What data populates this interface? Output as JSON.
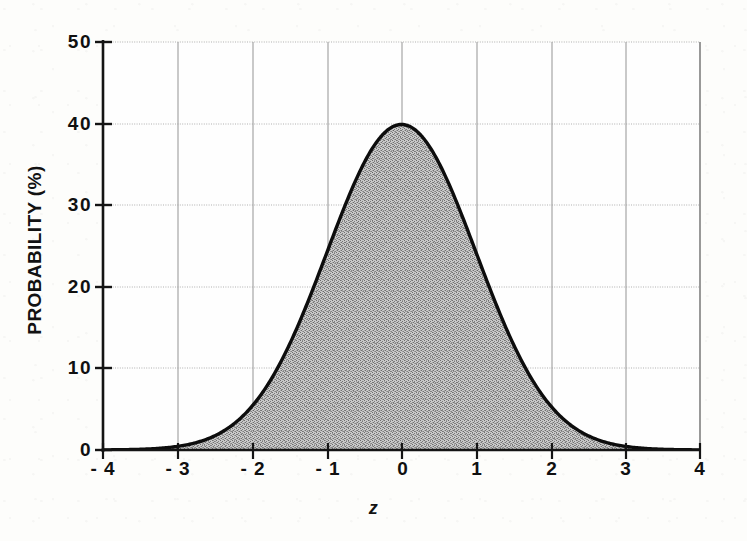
{
  "chart_data": {
    "type": "area",
    "title": "",
    "subtitle": "",
    "xlabel": "z",
    "ylabel": "PROBABILITY (%)",
    "xlim": [
      -4,
      4
    ],
    "ylim": [
      0,
      50
    ],
    "grid": true,
    "legend_position": "none",
    "curve_name": "standard normal probability density (percent)",
    "fill": "gray-dither-hatch",
    "x_tick_labels": [
      "- 4",
      "- 3",
      "- 2",
      "- 1",
      "0",
      "1",
      "2",
      "3",
      "4"
    ],
    "x_tick_values": [
      -4,
      -3,
      -2,
      -1,
      0,
      1,
      2,
      3,
      4
    ],
    "y_tick_labels": [
      "0",
      "10",
      "20",
      "30",
      "40",
      "50"
    ],
    "y_tick_values": [
      0,
      10,
      20,
      30,
      40,
      50
    ],
    "x": [
      -4,
      -3.75,
      -3.5,
      -3.25,
      -3,
      -2.75,
      -2.5,
      -2.25,
      -2,
      -1.75,
      -1.5,
      -1.25,
      -1,
      -0.75,
      -0.5,
      -0.25,
      0,
      0.25,
      0.5,
      0.75,
      1,
      1.25,
      1.5,
      1.75,
      2,
      2.25,
      2.5,
      2.75,
      3,
      3.25,
      3.5,
      3.75,
      4
    ],
    "values": [
      0.01,
      0.03,
      0.09,
      0.2,
      0.44,
      0.91,
      1.75,
      3.17,
      5.4,
      8.63,
      12.95,
      18.26,
      24.2,
      30.11,
      35.21,
      38.67,
      39.89,
      38.67,
      35.21,
      30.11,
      24.2,
      18.26,
      12.95,
      8.63,
      5.4,
      3.17,
      1.75,
      0.91,
      0.44,
      0.2,
      0.09,
      0.03,
      0.01
    ],
    "peak": {
      "x": 0,
      "y": 39.89
    },
    "colors": {
      "curve": "#111111",
      "fill": "#9a9a9a",
      "axis": "#1a1a1a",
      "grid": "#b4b4b4",
      "background": "#fdfdfb",
      "text": "#101010"
    }
  }
}
